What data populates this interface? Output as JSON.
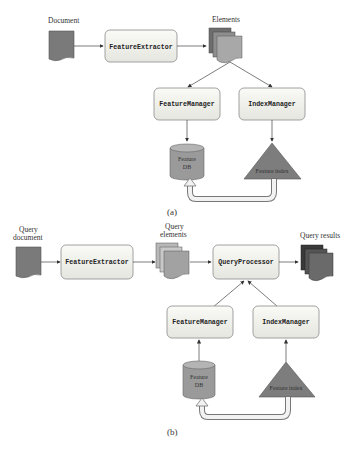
{
  "panel_a": {
    "caption": "(a)",
    "document_label": "Document",
    "elements_label": "Elements",
    "feature_extractor": "FeatureExtractor",
    "feature_manager": "FeatureManager",
    "index_manager": "IndexManager",
    "feature_db_line1": "Feature",
    "feature_db_line2": "DB",
    "feature_index": "Feature index"
  },
  "panel_b": {
    "caption": "(b)",
    "query_document_line1": "Query",
    "query_document_line2": "document",
    "query_elements_line1": "Query",
    "query_elements_line2": "elements",
    "query_results_label": "Query results",
    "feature_extractor": "FeatureExtractor",
    "query_processor": "QueryProcessor",
    "feature_manager": "FeatureManager",
    "index_manager": "IndexManager",
    "feature_db_line1": "Feature",
    "feature_db_line2": "DB",
    "feature_index": "Feature index"
  },
  "colors": {
    "box_fill": "#f1f1ec",
    "box_stroke": "#8a8a8a",
    "doc_fill": "#7a7a7a",
    "stack_fill_light": "#a9a9a9",
    "stack_fill_dark": "#4a4a4a",
    "db_fill": "#9a9a9a",
    "triangle_fill": "#7d7d7d",
    "arrow": "#444444",
    "feedback_fill": "#f2f2f2"
  }
}
